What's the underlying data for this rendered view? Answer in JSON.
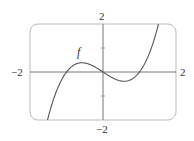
{
  "chart_data": {
    "type": "line",
    "title": "",
    "xlabel": "",
    "ylabel": "",
    "xlim": [
      -2,
      2
    ],
    "ylim": [
      -2,
      2
    ],
    "grid": false,
    "frame": "rounded-rectangle",
    "tick_labels": {
      "x_min": "−2",
      "x_max": "2",
      "y_min": "−2",
      "y_max": "2"
    },
    "y_ticks": [
      -1,
      1
    ],
    "annotations": [
      {
        "text": "f",
        "x": -0.6,
        "y": 0.75,
        "style": "italic"
      }
    ],
    "series": [
      {
        "name": "f",
        "formula": "x^3 - x",
        "x": [
          -1.52,
          -1.25,
          -1.0,
          -0.75,
          -0.58,
          -0.25,
          0,
          0.25,
          0.58,
          0.75,
          1.0,
          1.25,
          1.52
        ],
        "y": [
          -2.0,
          -0.7,
          0.0,
          0.33,
          0.385,
          0.23,
          0,
          -0.23,
          -0.385,
          -0.33,
          0.0,
          0.7,
          2.0
        ]
      }
    ]
  },
  "colors": {
    "curve": "#555555",
    "axes": "#777777",
    "frame": "#bbbbbb",
    "text": "#333333"
  }
}
